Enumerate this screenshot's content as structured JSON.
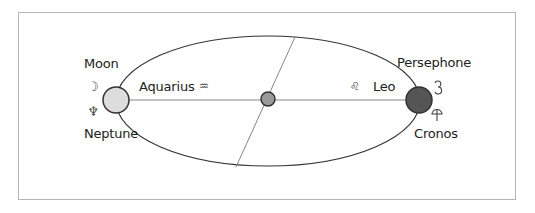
{
  "diagram": {
    "frame": {
      "border_color": "#b5b5b5"
    },
    "orbit": {
      "cx": 268,
      "cy": 101,
      "rx": 152,
      "ry": 65,
      "stroke": "#333333"
    },
    "axis_line": {
      "x1": 116,
      "y1": 100,
      "x2": 419,
      "y2": 100,
      "stroke": "#888888"
    },
    "tilted_line": {
      "x1": 295,
      "y1": 37,
      "x2": 236,
      "y2": 167,
      "stroke": "#888888"
    },
    "bodies": {
      "left": {
        "cx": 116,
        "cy": 100,
        "r": 13,
        "fill": "#dddddd"
      },
      "center": {
        "cx": 268,
        "cy": 99,
        "r": 7,
        "fill": "#999999"
      },
      "right": {
        "cx": 419,
        "cy": 100,
        "r": 13,
        "fill": "#555555"
      }
    },
    "labels": {
      "moon": "Moon",
      "neptune": "Neptune",
      "persephone": "Persephone",
      "cronos": "Cronos",
      "aquarius": "Aquarius",
      "leo": "Leo"
    },
    "glyphs": {
      "moon": "☽",
      "neptune": "♆",
      "aquarius": "♒",
      "leo": "♌",
      "persephone": "§",
      "cronos": "⚶"
    }
  }
}
